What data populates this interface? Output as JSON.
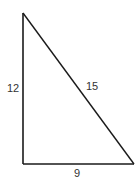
{
  "diagram": {
    "type": "right-triangle",
    "stroke_color": "#1a1a1a",
    "label_color": "#333333",
    "vertices": {
      "top": [
        23,
        13
      ],
      "right_angle": [
        23,
        164
      ],
      "bottom_right": [
        134,
        164
      ]
    },
    "sides": {
      "vertical_leg": {
        "label": "12"
      },
      "hypotenuse": {
        "label": "15"
      },
      "horizontal_leg": {
        "label": "9"
      }
    }
  }
}
